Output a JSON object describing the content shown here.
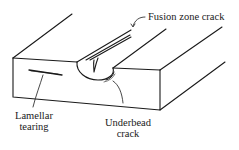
{
  "diagram": {
    "labels": {
      "fusion_zone_crack": "Fusion zone crack",
      "lamellar_line1": "Lamellar",
      "lamellar_line2": "tearing",
      "underbead_line1": "Underbead",
      "underbead_line2": "crack"
    },
    "colors": {
      "stroke": "#1a1a1a",
      "background": "#ffffff"
    }
  }
}
